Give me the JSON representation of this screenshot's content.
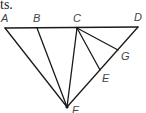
{
  "text_fragment": "ts.",
  "diagram": {
    "points": {
      "A": {
        "x": 5,
        "y": 28,
        "label": "A",
        "lx": 1,
        "ly": 22
      },
      "B": {
        "x": 37,
        "y": 28,
        "label": "B",
        "lx": 33,
        "ly": 22
      },
      "C": {
        "x": 77,
        "y": 28,
        "label": "C",
        "lx": 73,
        "ly": 22
      },
      "D": {
        "x": 138,
        "y": 27,
        "label": "D",
        "lx": 134,
        "ly": 21
      },
      "G": {
        "x": 118,
        "y": 50,
        "label": "G",
        "lx": 121,
        "ly": 60
      },
      "E": {
        "x": 100,
        "y": 70,
        "label": "E",
        "lx": 102,
        "ly": 82
      },
      "F": {
        "x": 67,
        "y": 107,
        "label": "F",
        "lx": 72,
        "ly": 114
      }
    },
    "segments": [
      [
        "A",
        "D"
      ],
      [
        "A",
        "F"
      ],
      [
        "B",
        "F"
      ],
      [
        "C",
        "F"
      ],
      [
        "D",
        "F"
      ],
      [
        "C",
        "E"
      ],
      [
        "C",
        "G"
      ]
    ],
    "stroke_color": "#1a1a1a"
  }
}
